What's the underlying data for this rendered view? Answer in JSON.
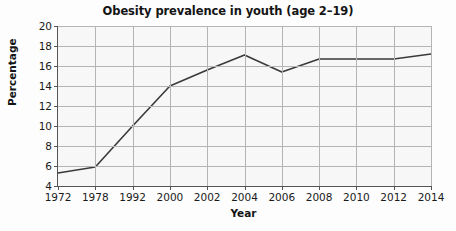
{
  "chart_data": {
    "type": "line",
    "title": "Obesity prevalence in youth (age 2–19)",
    "xlabel": "Year",
    "ylabel": "Percentage",
    "categories": [
      "1972",
      "1978",
      "1992",
      "2000",
      "2002",
      "2004",
      "2006",
      "2008",
      "2010",
      "2012",
      "2014"
    ],
    "values": [
      5.3,
      5.9,
      10.0,
      14.0,
      15.6,
      17.1,
      15.4,
      16.7,
      16.7,
      16.7,
      17.2
    ],
    "series": [
      {
        "name": "Obesity prevalence",
        "values": [
          5.3,
          5.9,
          10.0,
          14.0,
          15.6,
          17.1,
          15.4,
          16.7,
          16.7,
          16.7,
          17.2
        ]
      }
    ],
    "ylim": [
      4,
      20
    ],
    "yticks": [
      4,
      6,
      8,
      10,
      12,
      14,
      16,
      18,
      20
    ],
    "ytick_labels": [
      "4",
      "6",
      "8",
      "10",
      "12",
      "14",
      "16",
      "18",
      "20"
    ],
    "grid": true,
    "legend": "none",
    "line_color": "#3a3a3a",
    "grid_color": "#b4b4b4",
    "background_color": "#f7f7f7"
  }
}
